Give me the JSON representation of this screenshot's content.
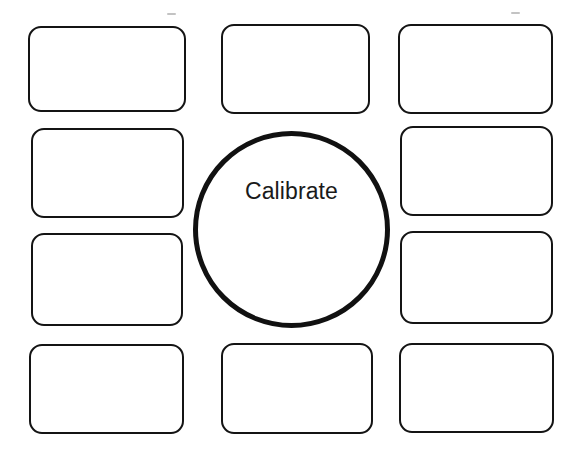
{
  "canvas": {
    "width": 579,
    "height": 459,
    "background_color": "#ffffff",
    "stroke_color": "#141414"
  },
  "diagram": {
    "type": "hub-and-spoke-blank-worksheet",
    "center": {
      "shape": "circle",
      "label": "Calibrate",
      "text_color": "#1a1a1a",
      "border_color": "#111111",
      "fill_color": "#ffffff",
      "x": 193,
      "y": 131,
      "width": 197,
      "height": 197
    },
    "boxes": [
      {
        "id": "box-top-left",
        "label": "",
        "x": 28,
        "y": 26,
        "width": 158,
        "height": 86
      },
      {
        "id": "box-top-center",
        "label": "",
        "x": 221,
        "y": 24,
        "width": 149,
        "height": 90
      },
      {
        "id": "box-top-right",
        "label": "",
        "x": 398,
        "y": 24,
        "width": 155,
        "height": 90
      },
      {
        "id": "box-mid-upper-left",
        "label": "",
        "x": 31,
        "y": 128,
        "width": 153,
        "height": 90
      },
      {
        "id": "box-mid-upper-right",
        "label": "",
        "x": 400,
        "y": 126,
        "width": 153,
        "height": 90
      },
      {
        "id": "box-mid-lower-left",
        "label": "",
        "x": 31,
        "y": 233,
        "width": 152,
        "height": 93
      },
      {
        "id": "box-mid-lower-right",
        "label": "",
        "x": 400,
        "y": 231,
        "width": 153,
        "height": 93
      },
      {
        "id": "box-bottom-left",
        "label": "",
        "x": 29,
        "y": 344,
        "width": 155,
        "height": 90
      },
      {
        "id": "box-bottom-center",
        "label": "",
        "x": 221,
        "y": 343,
        "width": 152,
        "height": 91
      },
      {
        "id": "box-bottom-right",
        "label": "",
        "x": 399,
        "y": 343,
        "width": 155,
        "height": 90
      }
    ],
    "scan_marks": [
      {
        "id": "scan-mark-left",
        "x": 167,
        "y": 13,
        "width": 9
      },
      {
        "id": "scan-mark-right",
        "x": 511,
        "y": 12,
        "width": 9
      }
    ]
  }
}
